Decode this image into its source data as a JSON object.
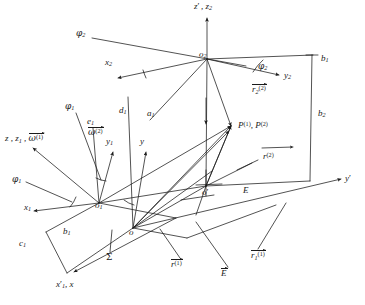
{
  "figure": {
    "type": "kinematic-coordinate-frame-diagram",
    "canvas": {
      "width": 365,
      "height": 305
    },
    "ink_color": "#1a1a1a",
    "background": "#ffffff"
  },
  "origins": [
    {
      "id": "o",
      "label": "o",
      "x": 133,
      "y": 228
    },
    {
      "id": "o1",
      "label": "o",
      "sub": "1",
      "x": 99,
      "y": 203
    },
    {
      "id": "o2",
      "label": "o",
      "sub": "2",
      "x": 207,
      "y": 59
    },
    {
      "id": "oprime",
      "label": "o",
      "prime": "'",
      "x": 206,
      "y": 186
    }
  ],
  "axis_labels": [
    {
      "name": "z-prime2-z2",
      "text": "z′ , z",
      "display": "z'2_z2",
      "x": 196,
      "y": 6
    },
    {
      "name": "x2",
      "text": "x",
      "display": "x2",
      "x": 106,
      "y": 62
    },
    {
      "name": "y2",
      "text": "y",
      "display": "y2",
      "x": 285,
      "y": 75
    },
    {
      "name": "z-z1-omega1",
      "text": "z , z1 , w(1)",
      "display": "z_z1_w1",
      "x": 6,
      "y": 138
    },
    {
      "name": "x1",
      "text": "x",
      "display": "x1",
      "x": 25,
      "y": 207
    },
    {
      "name": "y1",
      "text": "y",
      "display": "y1",
      "x": 108,
      "y": 141
    },
    {
      "name": "y",
      "text": "y",
      "display": "y",
      "x": 141,
      "y": 141
    },
    {
      "name": "x-prime1-x",
      "text": "x′1 , x",
      "display": "xp1_x",
      "x": 58,
      "y": 284
    },
    {
      "name": "y-prime",
      "text": "y′",
      "display": "yprime",
      "x": 347,
      "y": 178
    }
  ],
  "angle_labels": [
    {
      "name": "phi2-top",
      "text": "φ",
      "sub": "2",
      "x": 77,
      "y": 33
    },
    {
      "name": "phi2-arc",
      "text": "φ",
      "sub": "2",
      "x": 259,
      "y": 66
    },
    {
      "name": "phi1-top",
      "text": "φ",
      "sub": "1",
      "x": 66,
      "y": 106
    },
    {
      "name": "phi1-left",
      "text": "φ",
      "sub": "1",
      "x": 13,
      "y": 179
    }
  ],
  "segment_labels": [
    {
      "name": "d1",
      "text": "d",
      "sub": "1",
      "x": 120,
      "y": 110
    },
    {
      "name": "a1",
      "text": "a",
      "sub": "1",
      "x": 148,
      "y": 113
    },
    {
      "name": "e1",
      "text": "e",
      "sub": "1",
      "x": 88,
      "y": 121
    },
    {
      "name": "b1-right",
      "text": "b",
      "sub": "1",
      "x": 322,
      "y": 58
    },
    {
      "name": "b2-right",
      "text": "b",
      "sub": "2",
      "x": 319,
      "y": 113
    },
    {
      "name": "b1-left",
      "text": "b",
      "sub": "1",
      "x": 64,
      "y": 231
    },
    {
      "name": "c1",
      "text": "c",
      "sub": "1",
      "x": 20,
      "y": 243
    },
    {
      "name": "E-plane",
      "text": "E",
      "x": 244,
      "y": 190
    },
    {
      "name": "Sigma-plane",
      "text": "Σ",
      "x": 110,
      "y": 258
    }
  ],
  "point_labels": [
    {
      "name": "point-P",
      "text": "P(1) , P(2)",
      "display": "P1_P2",
      "x": 239,
      "y": 126
    }
  ],
  "vector_labels": [
    {
      "name": "omega2-vector",
      "base": "ω",
      "sup": "(2)",
      "x": 90,
      "y": 131
    },
    {
      "name": "r2-2-vector",
      "base": "r",
      "sub": "2",
      "sup": "(2)",
      "x": 254,
      "y": 89
    },
    {
      "name": "r-2-vector",
      "base": "r",
      "sup": "(2)",
      "x": 265,
      "y": 155
    },
    {
      "name": "r-1-vector",
      "base": "r",
      "sup": "(1)",
      "x": 173,
      "y": 263
    },
    {
      "name": "E-vector",
      "base": "E",
      "x": 222,
      "y": 272
    },
    {
      "name": "r1-1-vector",
      "base": "r",
      "sub": "1",
      "sup": "(1)",
      "x": 253,
      "y": 254
    }
  ]
}
